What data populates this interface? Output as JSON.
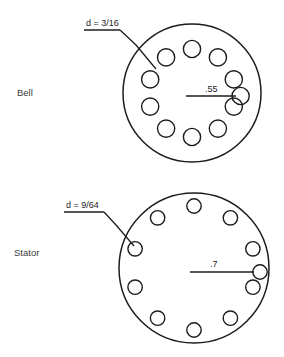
{
  "drawing": {
    "title": "Bell and Stator bolt circle detail",
    "background_color": "#ffffff",
    "line_color": "#1c1c1c",
    "text_color": "#1c1c1c",
    "label_color": "#3a3a3a"
  },
  "views": [
    {
      "id": "bell",
      "part_label": "Bell",
      "hole_note": "d = 3/16",
      "radius_dim": ".55",
      "hole_count": 10,
      "outline": {
        "cx": 192,
        "cy": 93,
        "r": 69
      },
      "bolt_circle": {
        "r": 44,
        "hole_r": 8.6
      },
      "hole_angles_deg": [
        0,
        36,
        72,
        108,
        144,
        180,
        216,
        252,
        288,
        324
      ],
      "note_anchor": {
        "x": 86,
        "y": 26
      },
      "note_shelf": {
        "x1": 84,
        "y1": 30,
        "x2": 120,
        "y2": 30
      },
      "leader_points": "120,30 136,45 156,69",
      "dim_line": {
        "x1": 186,
        "y1": 96,
        "x2": 236,
        "y2": 96
      },
      "dim_text_pos": {
        "x": 205,
        "y": 92
      }
    },
    {
      "id": "stator",
      "part_label": "Stator",
      "hole_note": "d = 9/64",
      "radius_dim": ".7",
      "hole_count": 10,
      "outline": {
        "cx": 194,
        "cy": 268,
        "r": 75
      },
      "bolt_circle": {
        "r": 62,
        "hole_r": 7.2
      },
      "hole_angles_deg": [
        0,
        36,
        72,
        108,
        144,
        180,
        216,
        252,
        288,
        324
      ],
      "note_anchor": {
        "x": 66,
        "y": 208
      },
      "note_shelf": {
        "x1": 64,
        "y1": 212,
        "x2": 104,
        "y2": 212
      },
      "leader_points": "104,212 116,225 134,246",
      "dim_line": {
        "x1": 190,
        "y1": 272,
        "x2": 258,
        "y2": 272
      },
      "dim_text_pos": {
        "x": 210,
        "y": 267
      }
    }
  ],
  "side_labels": [
    {
      "text": "Bell",
      "x": 17,
      "y": 96
    },
    {
      "text": "Stator",
      "x": 14,
      "y": 256
    }
  ]
}
